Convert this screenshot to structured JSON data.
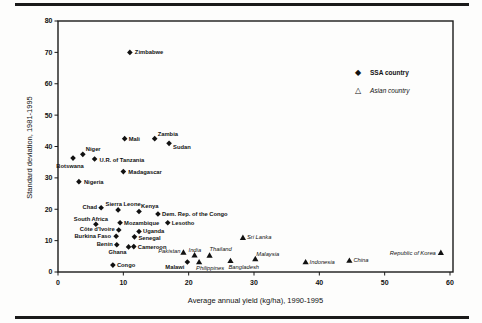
{
  "chart_data": {
    "type": "scatter",
    "title": "",
    "xlabel": "Average annual yield (kg/ha), 1990-1995",
    "ylabel": "Standard deviation, 1981-1995",
    "xlim": [
      0,
      60
    ],
    "ylim": [
      0,
      80
    ],
    "x_ticks": [
      0,
      10,
      20,
      30,
      40,
      50,
      60
    ],
    "y_ticks": [
      0,
      10,
      20,
      30,
      40,
      50,
      60,
      70,
      80
    ],
    "grid": false,
    "legend_position": "inside-upper-right",
    "marker_color": "#111111",
    "legend": [
      {
        "label": "SSA country",
        "marker": "filled-diamond",
        "icon": "◆"
      },
      {
        "label": "Asian country",
        "marker": "open-triangle",
        "icon": "△"
      }
    ],
    "series": [
      {
        "name": "SSA country",
        "marker": "diamond",
        "label_style": "bold",
        "points": [
          {
            "name": "Zimbabwe",
            "x": 11,
            "y": 70,
            "dx": 5,
            "dy": 0,
            "anchor": "start"
          },
          {
            "name": "Mali",
            "x": 10.2,
            "y": 42.5,
            "dx": 4,
            "dy": 0,
            "anchor": "start"
          },
          {
            "name": "Zambia",
            "x": 14.8,
            "y": 42.5,
            "dx": 3,
            "dy": -5,
            "anchor": "start"
          },
          {
            "name": "Sudan",
            "x": 17,
            "y": 41,
            "dx": 4,
            "dy": 4,
            "anchor": "start"
          },
          {
            "name": "Niger",
            "x": 3.8,
            "y": 37.5,
            "dx": 3,
            "dy": -5,
            "anchor": "start"
          },
          {
            "name": "Botswana",
            "x": 2.3,
            "y": 36.3,
            "dx": -3,
            "dy": 8,
            "anchor": "middle"
          },
          {
            "name": "U.R. of Tanzania",
            "x": 5.6,
            "y": 36,
            "dx": 5,
            "dy": 1,
            "anchor": "start"
          },
          {
            "name": "Madagascar",
            "x": 10,
            "y": 32,
            "dx": 5,
            "dy": 0,
            "anchor": "start"
          },
          {
            "name": "Nigeria",
            "x": 3.2,
            "y": 28.8,
            "dx": 5,
            "dy": 0,
            "anchor": "start"
          },
          {
            "name": "Chad",
            "x": 6.6,
            "y": 20.5,
            "dx": -4,
            "dy": -1,
            "anchor": "end"
          },
          {
            "name": "Sierra Leone",
            "x": 9.2,
            "y": 19.8,
            "dx": 5,
            "dy": -6,
            "anchor": "middle"
          },
          {
            "name": "Kenya",
            "x": 12.4,
            "y": 19.3,
            "dx": 2,
            "dy": -5,
            "anchor": "start"
          },
          {
            "name": "Dem. Rep. of the Congo",
            "x": 15.3,
            "y": 18.5,
            "dx": 4,
            "dy": 0,
            "anchor": "start"
          },
          {
            "name": "South Africa",
            "x": 5.8,
            "y": 15.2,
            "dx": -5,
            "dy": -5,
            "anchor": "middle"
          },
          {
            "name": "Mozambique",
            "x": 9.5,
            "y": 15.7,
            "dx": 4,
            "dy": 0,
            "anchor": "start"
          },
          {
            "name": "Lesotho",
            "x": 16.8,
            "y": 15.7,
            "dx": 4,
            "dy": 0,
            "anchor": "start"
          },
          {
            "name": "Côte d'Ivoire",
            "x": 9.3,
            "y": 13.4,
            "dx": -4,
            "dy": -1,
            "anchor": "end"
          },
          {
            "name": "Uganda",
            "x": 12.4,
            "y": 12.9,
            "dx": 4,
            "dy": -1,
            "anchor": "start"
          },
          {
            "name": "Burkina Faso",
            "x": 8.9,
            "y": 11.4,
            "dx": -5,
            "dy": 0,
            "anchor": "end"
          },
          {
            "name": "Senegal",
            "x": 11.7,
            "y": 11.2,
            "dx": 4,
            "dy": 1,
            "anchor": "start"
          },
          {
            "name": "Benin",
            "x": 9,
            "y": 8.7,
            "dx": -4,
            "dy": -1,
            "anchor": "end"
          },
          {
            "name": "Ghana",
            "x": 10.8,
            "y": 8,
            "dx": -2,
            "dy": 5,
            "anchor": "end"
          },
          {
            "name": "Cameroon",
            "x": 11.6,
            "y": 8.1,
            "dx": 4,
            "dy": 0,
            "anchor": "start"
          },
          {
            "name": "Congo",
            "x": 8.4,
            "y": 2.2,
            "dx": 4,
            "dy": 0,
            "anchor": "start"
          },
          {
            "name": "Malawi",
            "x": 19.8,
            "y": 3.2,
            "dx": -3,
            "dy": 5,
            "anchor": "end"
          }
        ]
      },
      {
        "name": "Asian country",
        "marker": "triangle",
        "label_style": "italic",
        "points": [
          {
            "name": "Pakistan",
            "x": 19.2,
            "y": 6.3,
            "dx": -3,
            "dy": -1,
            "anchor": "end"
          },
          {
            "name": "India",
            "x": 20.9,
            "y": 5.4,
            "dx": -6,
            "dy": -5,
            "anchor": "start"
          },
          {
            "name": "Thailand",
            "x": 23.2,
            "y": 5.3,
            "dx": 0,
            "dy": -6,
            "anchor": "start"
          },
          {
            "name": "Philippines",
            "x": 21.6,
            "y": 3.2,
            "dx": -3,
            "dy": 6,
            "anchor": "start"
          },
          {
            "name": "Bangladesh",
            "x": 26.4,
            "y": 3.6,
            "dx": -2,
            "dy": 6,
            "anchor": "start"
          },
          {
            "name": "Malaysia",
            "x": 30.2,
            "y": 4.2,
            "dx": 1,
            "dy": -5,
            "anchor": "start"
          },
          {
            "name": "Sri Lanka",
            "x": 28.3,
            "y": 11,
            "dx": 4,
            "dy": 0,
            "anchor": "start"
          },
          {
            "name": "Indonesia",
            "x": 37.9,
            "y": 3.2,
            "dx": 4,
            "dy": 0,
            "anchor": "start"
          },
          {
            "name": "China",
            "x": 44.6,
            "y": 3.7,
            "dx": 4,
            "dy": 0,
            "anchor": "start"
          },
          {
            "name": "Republic of Korea",
            "x": 58.6,
            "y": 6.2,
            "dx": -5,
            "dy": 0,
            "anchor": "end"
          }
        ]
      }
    ]
  }
}
